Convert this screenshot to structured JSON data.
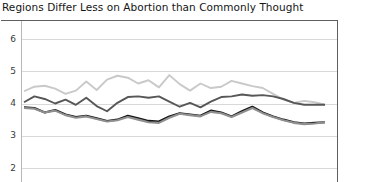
{
  "chart_data": {
    "type": "line",
    "title": "Regions Differ Less on Abortion than Commonly Thought",
    "xlabel": "",
    "ylabel": "",
    "ylim": [
      2,
      6
    ],
    "yticks": [
      6,
      5,
      4,
      3,
      2
    ],
    "grid": true,
    "legend": "none",
    "x": [
      1,
      2,
      3,
      4,
      5,
      6,
      7,
      8,
      9,
      10,
      11,
      12,
      13,
      14,
      15,
      16,
      17,
      18,
      19,
      20,
      21,
      22,
      23,
      24,
      25,
      26,
      27,
      28,
      29,
      30
    ],
    "series": [
      {
        "name": "series-light-gray",
        "color": "#c9c9c9",
        "values": [
          4.38,
          4.52,
          4.55,
          4.46,
          4.3,
          4.4,
          4.68,
          4.42,
          4.74,
          4.86,
          4.8,
          4.62,
          4.72,
          4.5,
          4.88,
          4.6,
          4.4,
          4.62,
          4.48,
          4.52,
          4.7,
          4.62,
          4.54,
          4.48,
          4.3,
          4.12,
          4.02,
          4.08,
          4.04,
          3.96
        ]
      },
      {
        "name": "series-dark-gray",
        "color": "#575757",
        "values": [
          4.04,
          4.22,
          4.14,
          4.0,
          4.12,
          3.96,
          4.18,
          3.92,
          3.76,
          4.02,
          4.2,
          4.22,
          4.18,
          4.22,
          4.06,
          3.9,
          4.02,
          3.88,
          4.06,
          4.2,
          4.22,
          4.28,
          4.24,
          4.26,
          4.22,
          4.14,
          4.02,
          3.96,
          3.96,
          3.96
        ]
      },
      {
        "name": "series-black",
        "color": "#151515",
        "values": [
          3.88,
          3.86,
          3.72,
          3.8,
          3.66,
          3.58,
          3.62,
          3.54,
          3.46,
          3.5,
          3.62,
          3.54,
          3.46,
          3.44,
          3.6,
          3.7,
          3.66,
          3.62,
          3.78,
          3.72,
          3.6,
          3.76,
          3.9,
          3.72,
          3.6,
          3.5,
          3.42,
          3.38,
          3.4,
          3.42
        ]
      },
      {
        "name": "series-mid-gray",
        "color": "#8f8f8f",
        "values": [
          3.86,
          3.84,
          3.72,
          3.78,
          3.64,
          3.56,
          3.6,
          3.52,
          3.44,
          3.48,
          3.58,
          3.5,
          3.42,
          3.4,
          3.56,
          3.68,
          3.64,
          3.6,
          3.74,
          3.7,
          3.58,
          3.72,
          3.86,
          3.7,
          3.58,
          3.48,
          3.4,
          3.36,
          3.38,
          3.42
        ]
      }
    ]
  }
}
